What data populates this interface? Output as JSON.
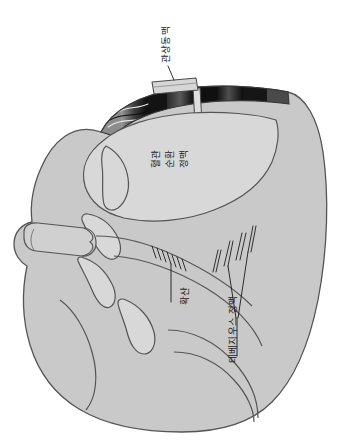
{
  "figure": {
    "orientation": "labels rotated 90 degrees counter-clockwise",
    "background_color": "#ffffff"
  },
  "colors": {
    "outline": "#555555",
    "myocardium_fill": "#c9c9c9",
    "chamber_fill": "#d8d8d8",
    "wedge_dark": "#171717",
    "wedge_mid": "#4a4a4a",
    "wedge_light": "#8d8d8d",
    "vessel_fill": "#d0d0d0",
    "leader_line": "#1a1a1a",
    "label_text": "#1a1a1a"
  },
  "labels": {
    "coronary_artery": "관상동맥",
    "wedge_line_1": "혈관",
    "wedge_line_2": "순환",
    "wedge_line_3": "정맥",
    "diffusion": "확산",
    "thebesian_vein": "테베지우스 정맥"
  },
  "annotations": [
    {
      "id": "coronary-artery",
      "text": "관상동맥",
      "leader": "line from label down-left to the coronary artery tube at the top of the wedge"
    },
    {
      "id": "wedge-labels",
      "text": "혈관 순환 정맥",
      "leader": "none, placed directly beneath the dark myocardial wedge"
    },
    {
      "id": "diffusion",
      "text": "확산",
      "leader": "vertical line up to the hatched tick marks on the endocardial surface"
    },
    {
      "id": "thebesian-vein",
      "text": "테베지우스 정맥",
      "leader": "line up to the group of narrow vein spikes crossing the ventricular wall"
    }
  ]
}
